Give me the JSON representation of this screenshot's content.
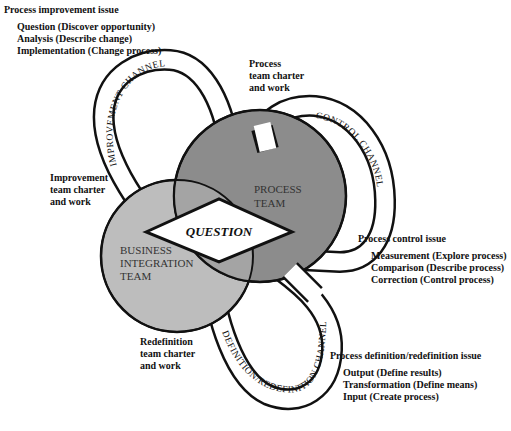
{
  "colors": {
    "process_team_fill": "#8c8c8c",
    "business_team_fill": "#bdbdbd",
    "overlap_fill": "#a4a4a4",
    "channel_fill": "#ffffff",
    "outline": "#111111"
  },
  "issues": {
    "improvement": {
      "title": "Process improvement issue",
      "items": [
        "Question (Discover opportunity)",
        "Analysis (Describe change)",
        "Implementation (Change process)"
      ]
    },
    "control": {
      "title": "Process control issue",
      "items": [
        "Measurement (Explore process)",
        "Comparison (Describe process)",
        "Correction (Control process)"
      ]
    },
    "definition": {
      "title": "Process definition/redefinition issue",
      "items": [
        "Output (Define results)",
        "Transformation (Define means)",
        "Input (Create process)"
      ]
    }
  },
  "charters": {
    "process": [
      "Process",
      "team charter",
      "and work"
    ],
    "improvement": [
      "Improvement",
      "team charter",
      "and work"
    ],
    "redefinition": [
      "Redefinition",
      "team charter",
      "and work"
    ]
  },
  "teams": {
    "process": [
      "PROCESS",
      "TEAM"
    ],
    "business": [
      "BUSINESS",
      "INTEGRATION",
      "TEAM"
    ]
  },
  "center": {
    "label": "QUESTION"
  },
  "channels": {
    "improvement": "IMPROVEMENT CHANNEL",
    "control": "CONTROL CHANNEL",
    "definition": "DEFINITION/REDEFINITION CHANNEL"
  }
}
